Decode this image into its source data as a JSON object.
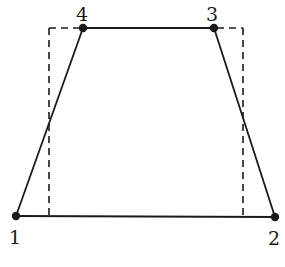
{
  "diagram": {
    "stroke_color": "#1a1a1a",
    "background": "#ffffff",
    "nodes": [
      {
        "id": "1",
        "label": "1",
        "x": 16,
        "y": 216,
        "label_x": 9,
        "label_y": 244
      },
      {
        "id": "2",
        "label": "2",
        "x": 275,
        "y": 217,
        "label_x": 268,
        "label_y": 245
      },
      {
        "id": "3",
        "label": "3",
        "x": 214,
        "y": 28,
        "label_x": 206,
        "label_y": 21
      },
      {
        "id": "4",
        "label": "4",
        "x": 83,
        "y": 28,
        "label_x": 76,
        "label_y": 21
      }
    ],
    "solid_edges": [
      [
        "1",
        "2"
      ],
      [
        "2",
        "3"
      ],
      [
        "3",
        "4"
      ],
      [
        "4",
        "1"
      ]
    ],
    "dashed_rectangle": {
      "left": 49,
      "top": 28,
      "right": 243,
      "bottom": 216
    }
  }
}
